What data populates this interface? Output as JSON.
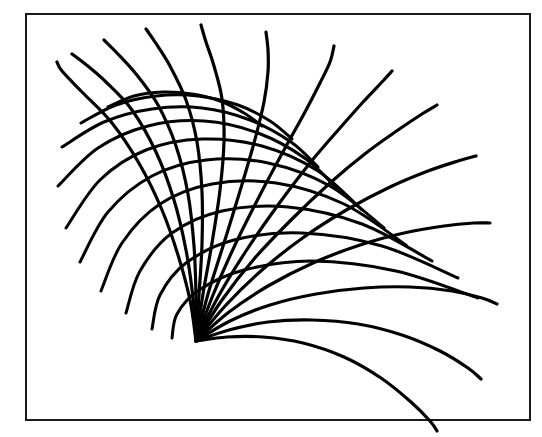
{
  "figure": {
    "kind": "line-drawing",
    "background_color": "#ffffff",
    "ink_color": "#000000"
  },
  "canvas": {
    "width": 542,
    "height": 437
  },
  "frame": {
    "name": "figure-border",
    "x": 25,
    "y": 13,
    "width": 506,
    "height": 408,
    "stroke_width": 2,
    "stroke_color": "#1a1a1a",
    "fill_color": "#ffffff"
  },
  "source_point": {
    "x": 196,
    "y": 341,
    "label": "origin"
  },
  "chart_data": {
    "type": "line",
    "xlabel": "",
    "ylabel": "",
    "xlim": [
      25,
      531
    ],
    "ylim": [
      13,
      421
    ],
    "grid": false,
    "legend": null,
    "origin": [
      196,
      341
    ],
    "stroke_color": "#000000",
    "series": [
      {
        "name": "trajectory-1",
        "stroke_width": 3.2,
        "points": [
          [
            196,
            341
          ],
          [
            190,
            300
          ],
          [
            178,
            255
          ],
          [
            162,
            210
          ],
          [
            140,
            165
          ],
          [
            112,
            123
          ],
          [
            82,
            92
          ],
          [
            62,
            71
          ],
          [
            57,
            62
          ]
        ]
      },
      {
        "name": "trajectory-2",
        "stroke_width": 3.2,
        "points": [
          [
            196,
            341
          ],
          [
            193,
            298
          ],
          [
            186,
            250
          ],
          [
            174,
            200
          ],
          [
            156,
            152
          ],
          [
            132,
            110
          ],
          [
            106,
            82
          ],
          [
            84,
            63
          ],
          [
            72,
            54
          ]
        ]
      },
      {
        "name": "trajectory-3",
        "stroke_width": 3.2,
        "points": [
          [
            196,
            341
          ],
          [
            196,
            296
          ],
          [
            194,
            246
          ],
          [
            188,
            194
          ],
          [
            176,
            146
          ],
          [
            158,
            105
          ],
          [
            136,
            74
          ],
          [
            116,
            52
          ],
          [
            104,
            40
          ]
        ]
      },
      {
        "name": "trajectory-4",
        "stroke_width": 3.2,
        "points": [
          [
            196,
            341
          ],
          [
            199,
            295
          ],
          [
            202,
            244
          ],
          [
            202,
            192
          ],
          [
            197,
            142
          ],
          [
            186,
            100
          ],
          [
            170,
            66
          ],
          [
            155,
            42
          ],
          [
            146,
            29
          ]
        ]
      },
      {
        "name": "trajectory-5",
        "stroke_width": 3.2,
        "points": [
          [
            196,
            341
          ],
          [
            203,
            294
          ],
          [
            212,
            243
          ],
          [
            220,
            190
          ],
          [
            224,
            141
          ],
          [
            222,
            99
          ],
          [
            214,
            66
          ],
          [
            206,
            42
          ],
          [
            201,
            25
          ]
        ]
      },
      {
        "name": "trajectory-6",
        "stroke_width": 3.2,
        "points": [
          [
            196,
            341
          ],
          [
            208,
            294
          ],
          [
            224,
            243
          ],
          [
            240,
            191
          ],
          [
            254,
            143
          ],
          [
            264,
            102
          ],
          [
            268,
            72
          ],
          [
            268,
            50
          ],
          [
            266,
            32
          ]
        ]
      },
      {
        "name": "trajectory-7",
        "stroke_width": 3.2,
        "points": [
          [
            196,
            341
          ],
          [
            213,
            295
          ],
          [
            235,
            245
          ],
          [
            260,
            195
          ],
          [
            284,
            150
          ],
          [
            305,
            112
          ],
          [
            320,
            83
          ],
          [
            330,
            62
          ],
          [
            334,
            46
          ]
        ]
      },
      {
        "name": "trajectory-8",
        "stroke_width": 3.2,
        "points": [
          [
            196,
            341
          ],
          [
            218,
            297
          ],
          [
            246,
            251
          ],
          [
            278,
            205
          ],
          [
            310,
            163
          ],
          [
            340,
            128
          ],
          [
            364,
            101
          ],
          [
            382,
            82
          ],
          [
            392,
            71
          ]
        ]
      },
      {
        "name": "trajectory-9",
        "stroke_width": 3.2,
        "points": [
          [
            196,
            341
          ],
          [
            222,
            300
          ],
          [
            254,
            259
          ],
          [
            292,
            219
          ],
          [
            330,
            183
          ],
          [
            366,
            153
          ],
          [
            398,
            130
          ],
          [
            422,
            114
          ],
          [
            437,
            105
          ]
        ]
      },
      {
        "name": "trajectory-10",
        "stroke_width": 3.2,
        "points": [
          [
            196,
            341
          ],
          [
            226,
            305
          ],
          [
            262,
            270
          ],
          [
            304,
            237
          ],
          [
            348,
            209
          ],
          [
            390,
            187
          ],
          [
            428,
            171
          ],
          [
            458,
            161
          ],
          [
            476,
            156
          ]
        ]
      },
      {
        "name": "trajectory-11",
        "stroke_width": 3.2,
        "points": [
          [
            196,
            341
          ],
          [
            229,
            312
          ],
          [
            268,
            286
          ],
          [
            313,
            263
          ],
          [
            360,
            245
          ],
          [
            404,
            233
          ],
          [
            444,
            226
          ],
          [
            474,
            223
          ],
          [
            490,
            223
          ]
        ]
      },
      {
        "name": "trajectory-12",
        "stroke_width": 3.2,
        "points": [
          [
            196,
            341
          ],
          [
            230,
            321
          ],
          [
            270,
            305
          ],
          [
            316,
            294
          ],
          [
            364,
            288
          ],
          [
            410,
            287
          ],
          [
            452,
            291
          ],
          [
            482,
            298
          ],
          [
            497,
            304
          ]
        ]
      },
      {
        "name": "trajectory-13",
        "stroke_width": 3.2,
        "points": [
          [
            196,
            341
          ],
          [
            229,
            330
          ],
          [
            268,
            322
          ],
          [
            312,
            320
          ],
          [
            358,
            324
          ],
          [
            402,
            335
          ],
          [
            440,
            351
          ],
          [
            468,
            368
          ],
          [
            481,
            379
          ]
        ]
      },
      {
        "name": "trajectory-14",
        "stroke_width": 3.2,
        "points": [
          [
            196,
            341
          ],
          [
            227,
            337
          ],
          [
            263,
            337
          ],
          [
            303,
            343
          ],
          [
            344,
            357
          ],
          [
            381,
            378
          ],
          [
            411,
            402
          ],
          [
            430,
            421
          ],
          [
            437,
            431
          ]
        ]
      },
      {
        "name": "arc-1",
        "stroke_width": 3.0,
        "points": [
          [
            108,
            107
          ],
          [
            134,
            96
          ],
          [
            163,
            92
          ],
          [
            192,
            94
          ],
          [
            220,
            101
          ],
          [
            244,
            113
          ],
          [
            262,
            126
          ]
        ]
      },
      {
        "name": "arc-2",
        "stroke_width": 3.0,
        "points": [
          [
            81,
            123
          ],
          [
            116,
            105
          ],
          [
            156,
            96
          ],
          [
            198,
            96
          ],
          [
            238,
            105
          ],
          [
            270,
            121
          ],
          [
            292,
            139
          ]
        ]
      },
      {
        "name": "arc-3",
        "stroke_width": 3.0,
        "points": [
          [
            62,
            147
          ],
          [
            104,
            122
          ],
          [
            152,
            109
          ],
          [
            202,
            108
          ],
          [
            250,
            120
          ],
          [
            291,
            142
          ],
          [
            318,
            167
          ]
        ]
      },
      {
        "name": "arc-4",
        "stroke_width": 3.0,
        "points": [
          [
            58,
            186
          ],
          [
            98,
            148
          ],
          [
            148,
            126
          ],
          [
            204,
            121
          ],
          [
            258,
            133
          ],
          [
            306,
            159
          ],
          [
            340,
            192
          ]
        ]
      },
      {
        "name": "arc-5",
        "stroke_width": 3.0,
        "points": [
          [
            66,
            228
          ],
          [
            100,
            180
          ],
          [
            146,
            150
          ],
          [
            202,
            139
          ],
          [
            262,
            146
          ],
          [
            318,
            171
          ],
          [
            362,
            210
          ]
        ]
      },
      {
        "name": "arc-6",
        "stroke_width": 3.0,
        "points": [
          [
            80,
            262
          ],
          [
            108,
            212
          ],
          [
            152,
            176
          ],
          [
            206,
            160
          ],
          [
            268,
            163
          ],
          [
            330,
            186
          ],
          [
            384,
            228
          ]
        ]
      },
      {
        "name": "arc-7",
        "stroke_width": 3.0,
        "points": [
          [
            101,
            291
          ],
          [
            122,
            243
          ],
          [
            160,
            204
          ],
          [
            212,
            184
          ],
          [
            276,
            183
          ],
          [
            344,
            204
          ],
          [
            406,
            245
          ]
        ]
      },
      {
        "name": "arc-8",
        "stroke_width": 3.0,
        "points": [
          [
            126,
            313
          ],
          [
            140,
            271
          ],
          [
            172,
            233
          ],
          [
            222,
            211
          ],
          [
            288,
            207
          ],
          [
            362,
            224
          ],
          [
            432,
            261
          ]
        ]
      },
      {
        "name": "arc-9",
        "stroke_width": 3.0,
        "points": [
          [
            152,
            329
          ],
          [
            160,
            295
          ],
          [
            186,
            263
          ],
          [
            234,
            240
          ],
          [
            302,
            233
          ],
          [
            382,
            246
          ],
          [
            458,
            278
          ]
        ]
      },
      {
        "name": "arc-10",
        "stroke_width": 3.0,
        "points": [
          [
            172,
            338
          ],
          [
            177,
            314
          ],
          [
            199,
            290
          ],
          [
            244,
            270
          ],
          [
            312,
            261
          ],
          [
            396,
            271
          ],
          [
            478,
            298
          ]
        ]
      }
    ]
  }
}
